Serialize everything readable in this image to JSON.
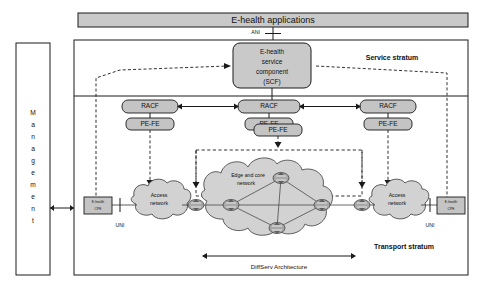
{
  "diagram": {
    "top_bar": {
      "label": "E-health applications"
    },
    "interface_labels": {
      "ani": "ANI",
      "uni_left": "UNI",
      "uni_right": "UNI"
    },
    "management_panel": {
      "label": "Management",
      "letters": [
        "M",
        "a",
        "n",
        "a",
        "g",
        "e",
        "m",
        "e",
        "n",
        "t"
      ]
    },
    "strata": {
      "service": "Service stratum",
      "transport": "Transport stratum"
    },
    "service_component": {
      "line1": "E-health",
      "line2": "service",
      "line3": "component",
      "line4": "(SCF)"
    },
    "racf_nodes": [
      {
        "id": "racf-left",
        "label": "RACF"
      },
      {
        "id": "racf-center",
        "label": "RACF"
      },
      {
        "id": "racf-right",
        "label": "RACF"
      }
    ],
    "pefe_nodes": [
      {
        "id": "pefe-left",
        "label": "PE-FE"
      },
      {
        "id": "pefe-center-back",
        "label": "PE-FE"
      },
      {
        "id": "pefe-center-front",
        "label": "PE-FE"
      },
      {
        "id": "pefe-right",
        "label": "PE-FE"
      }
    ],
    "clouds": [
      {
        "id": "access-left",
        "line1": "Access",
        "line2": "network"
      },
      {
        "id": "core",
        "line1": "Edge and core",
        "line2": "network"
      },
      {
        "id": "access-right",
        "line1": "Access",
        "line2": "network"
      }
    ],
    "cpe_nodes": [
      {
        "id": "cpe-left",
        "line1": "E-health",
        "line2": "CPE"
      },
      {
        "id": "cpe-right",
        "line1": "E-health",
        "line2": "CPE"
      }
    ],
    "bottom_annotation": {
      "label": "DiffServ Architecture"
    },
    "colors": {
      "outline": "#1a1a1a",
      "box_fill": "#c9c9c9",
      "cloud_fill": "#d2d2d2",
      "router_fill": "#a8a8a8",
      "background": "#ffffff"
    }
  }
}
